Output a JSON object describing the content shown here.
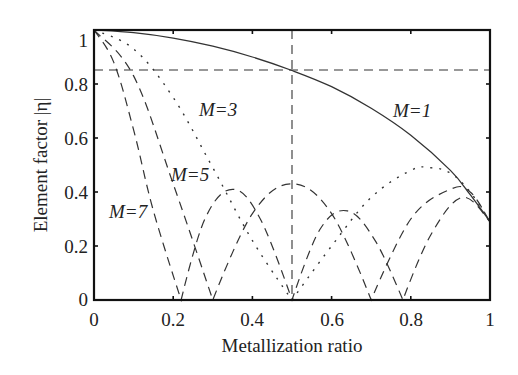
{
  "chart_data": {
    "type": "line",
    "title": "",
    "xlabel": "Metallization ratio",
    "ylabel": "Element factor |η|",
    "xlim": [
      0,
      1
    ],
    "ylim": [
      0,
      1.02
    ],
    "xticks": [
      "0",
      "0.2",
      "0.4",
      "0.6",
      "0.8",
      "1"
    ],
    "yticks": [
      "0",
      "0.2",
      "0.4",
      "0.6",
      "0.8",
      "1"
    ],
    "grid": false,
    "reference_lines": {
      "horizontal_y": 0.85,
      "vertical_x": 0.5
    },
    "annotations": [
      "M=1",
      "M=3",
      "M=5",
      "M=7"
    ],
    "series": [
      {
        "name": "M=1",
        "style": "solid",
        "x": [
          0,
          0.1,
          0.2,
          0.3,
          0.4,
          0.5,
          0.6,
          0.7,
          0.8,
          0.9,
          0.95,
          1.0
        ],
        "values": [
          1.0,
          0.99,
          0.97,
          0.94,
          0.9,
          0.85,
          0.79,
          0.71,
          0.61,
          0.48,
          0.39,
          0.29
        ]
      },
      {
        "name": "M=3",
        "style": "dotted",
        "x": [
          0,
          0.1,
          0.2,
          0.3,
          0.4,
          0.5,
          0.6,
          0.7,
          0.8,
          0.85,
          0.9,
          0.95,
          1.0
        ],
        "values": [
          1.0,
          0.93,
          0.75,
          0.49,
          0.22,
          0.0,
          0.2,
          0.38,
          0.48,
          0.49,
          0.47,
          0.4,
          0.29
        ]
      },
      {
        "name": "M=5",
        "style": "dashed",
        "x": [
          0,
          0.1,
          0.2,
          0.3,
          0.4,
          0.5,
          0.6,
          0.7,
          0.8,
          0.9,
          0.95,
          1.0
        ],
        "values": [
          1.0,
          0.83,
          0.43,
          0.0,
          0.32,
          0.43,
          0.32,
          0.0,
          0.3,
          0.41,
          0.4,
          0.29
        ]
      },
      {
        "name": "M=7",
        "style": "dashed",
        "x": [
          0,
          0.05,
          0.1,
          0.15,
          0.22,
          0.28,
          0.35,
          0.42,
          0.5,
          0.57,
          0.64,
          0.71,
          0.78,
          0.85,
          0.93,
          1.0
        ],
        "values": [
          1.0,
          0.88,
          0.63,
          0.33,
          0.0,
          0.3,
          0.41,
          0.3,
          0.0,
          0.26,
          0.33,
          0.22,
          0.0,
          0.24,
          0.38,
          0.29
        ]
      }
    ]
  },
  "labels": {
    "xlabel": "Metallization ratio",
    "ylabel": "Element factor |η|",
    "m1": "M=1",
    "m3": "M=3",
    "m5": "M=5",
    "m7": "M=7",
    "x0": "0",
    "x1": "0.2",
    "x2": "0.4",
    "x3": "0.6",
    "x4": "0.8",
    "x5": "1",
    "y0": "0",
    "y1": "0.2",
    "y2": "0.4",
    "y3": "0.6",
    "y4": "0.8",
    "y5": "1"
  }
}
